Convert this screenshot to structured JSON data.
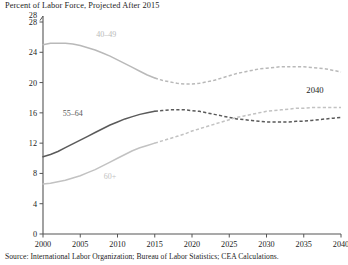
{
  "chart_data": {
    "type": "line",
    "title": "Percent of Labor Force, Projected After 2015",
    "source": "Source: International Labor Organization; Bureau of Labor Statistics; CEA Calculations.",
    "xlabel": "",
    "ylabel": "",
    "xlim": [
      2000,
      2040
    ],
    "ylim": [
      0,
      28
    ],
    "xticks": [
      2000,
      2005,
      2010,
      2015,
      2020,
      2025,
      2030,
      2035,
      2040
    ],
    "yticks": [
      0,
      4,
      8,
      12,
      16,
      20,
      24,
      28
    ],
    "grid": false,
    "legend": "inline-labels",
    "projection_starts": 2015,
    "annotations": [
      {
        "text": "2040",
        "x": 2036.5,
        "y": 18.6,
        "name": "year-2040-annotation"
      }
    ],
    "series": [
      {
        "name": "40-49",
        "label": "40–49",
        "color": "#b9b9b9",
        "label_x": 2008.5,
        "label_y": 26.0,
        "x": [
          2000,
          2001,
          2002,
          2003,
          2004,
          2005,
          2006,
          2007,
          2008,
          2009,
          2010,
          2011,
          2012,
          2013,
          2014,
          2015,
          2016,
          2017,
          2018,
          2019,
          2020,
          2021,
          2022,
          2023,
          2024,
          2025,
          2026,
          2027,
          2028,
          2029,
          2030,
          2031,
          2032,
          2033,
          2034,
          2035,
          2036,
          2037,
          2038,
          2039,
          2040
        ],
        "y": [
          25.0,
          25.2,
          25.2,
          25.2,
          25.1,
          24.9,
          24.6,
          24.3,
          23.9,
          23.5,
          23.0,
          22.5,
          22.0,
          21.5,
          21.0,
          20.6,
          20.3,
          20.1,
          19.9,
          19.8,
          19.8,
          19.9,
          20.1,
          20.3,
          20.6,
          20.9,
          21.2,
          21.4,
          21.6,
          21.8,
          21.9,
          22.0,
          22.1,
          22.1,
          22.1,
          22.1,
          22.0,
          21.9,
          21.8,
          21.6,
          21.4
        ]
      },
      {
        "name": "55-64",
        "label": "55–64",
        "color": "#5a5a5a",
        "label_x": 2004.0,
        "label_y": 15.6,
        "x": [
          2000,
          2001,
          2002,
          2003,
          2004,
          2005,
          2006,
          2007,
          2008,
          2009,
          2010,
          2011,
          2012,
          2013,
          2014,
          2015,
          2016,
          2017,
          2018,
          2019,
          2020,
          2021,
          2022,
          2023,
          2024,
          2025,
          2026,
          2027,
          2028,
          2029,
          2030,
          2031,
          2032,
          2033,
          2034,
          2035,
          2036,
          2037,
          2038,
          2039,
          2040
        ],
        "y": [
          10.2,
          10.5,
          10.9,
          11.4,
          11.9,
          12.4,
          12.9,
          13.4,
          13.9,
          14.4,
          14.8,
          15.2,
          15.5,
          15.8,
          16.0,
          16.2,
          16.3,
          16.4,
          16.4,
          16.4,
          16.3,
          16.2,
          16.0,
          15.8,
          15.6,
          15.4,
          15.2,
          15.1,
          15.0,
          14.9,
          14.8,
          14.8,
          14.8,
          14.8,
          14.9,
          14.9,
          15.0,
          15.1,
          15.2,
          15.3,
          15.4
        ]
      },
      {
        "name": "60+",
        "label": "60+",
        "color": "#c2c2c2",
        "label_x": 2009.0,
        "label_y": 7.3,
        "x": [
          2000,
          2001,
          2002,
          2003,
          2004,
          2005,
          2006,
          2007,
          2008,
          2009,
          2010,
          2011,
          2012,
          2013,
          2014,
          2015,
          2016,
          2017,
          2018,
          2019,
          2020,
          2021,
          2022,
          2023,
          2024,
          2025,
          2026,
          2027,
          2028,
          2029,
          2030,
          2031,
          2032,
          2033,
          2034,
          2035,
          2036,
          2037,
          2038,
          2039,
          2040
        ],
        "y": [
          6.6,
          6.7,
          6.9,
          7.1,
          7.4,
          7.7,
          8.1,
          8.5,
          9.0,
          9.5,
          10.0,
          10.5,
          11.0,
          11.4,
          11.7,
          12.0,
          12.3,
          12.6,
          12.9,
          13.2,
          13.6,
          13.9,
          14.2,
          14.5,
          14.8,
          15.1,
          15.4,
          15.6,
          15.8,
          16.0,
          16.2,
          16.3,
          16.4,
          16.5,
          16.6,
          16.6,
          16.7,
          16.7,
          16.7,
          16.7,
          16.7
        ]
      }
    ]
  }
}
